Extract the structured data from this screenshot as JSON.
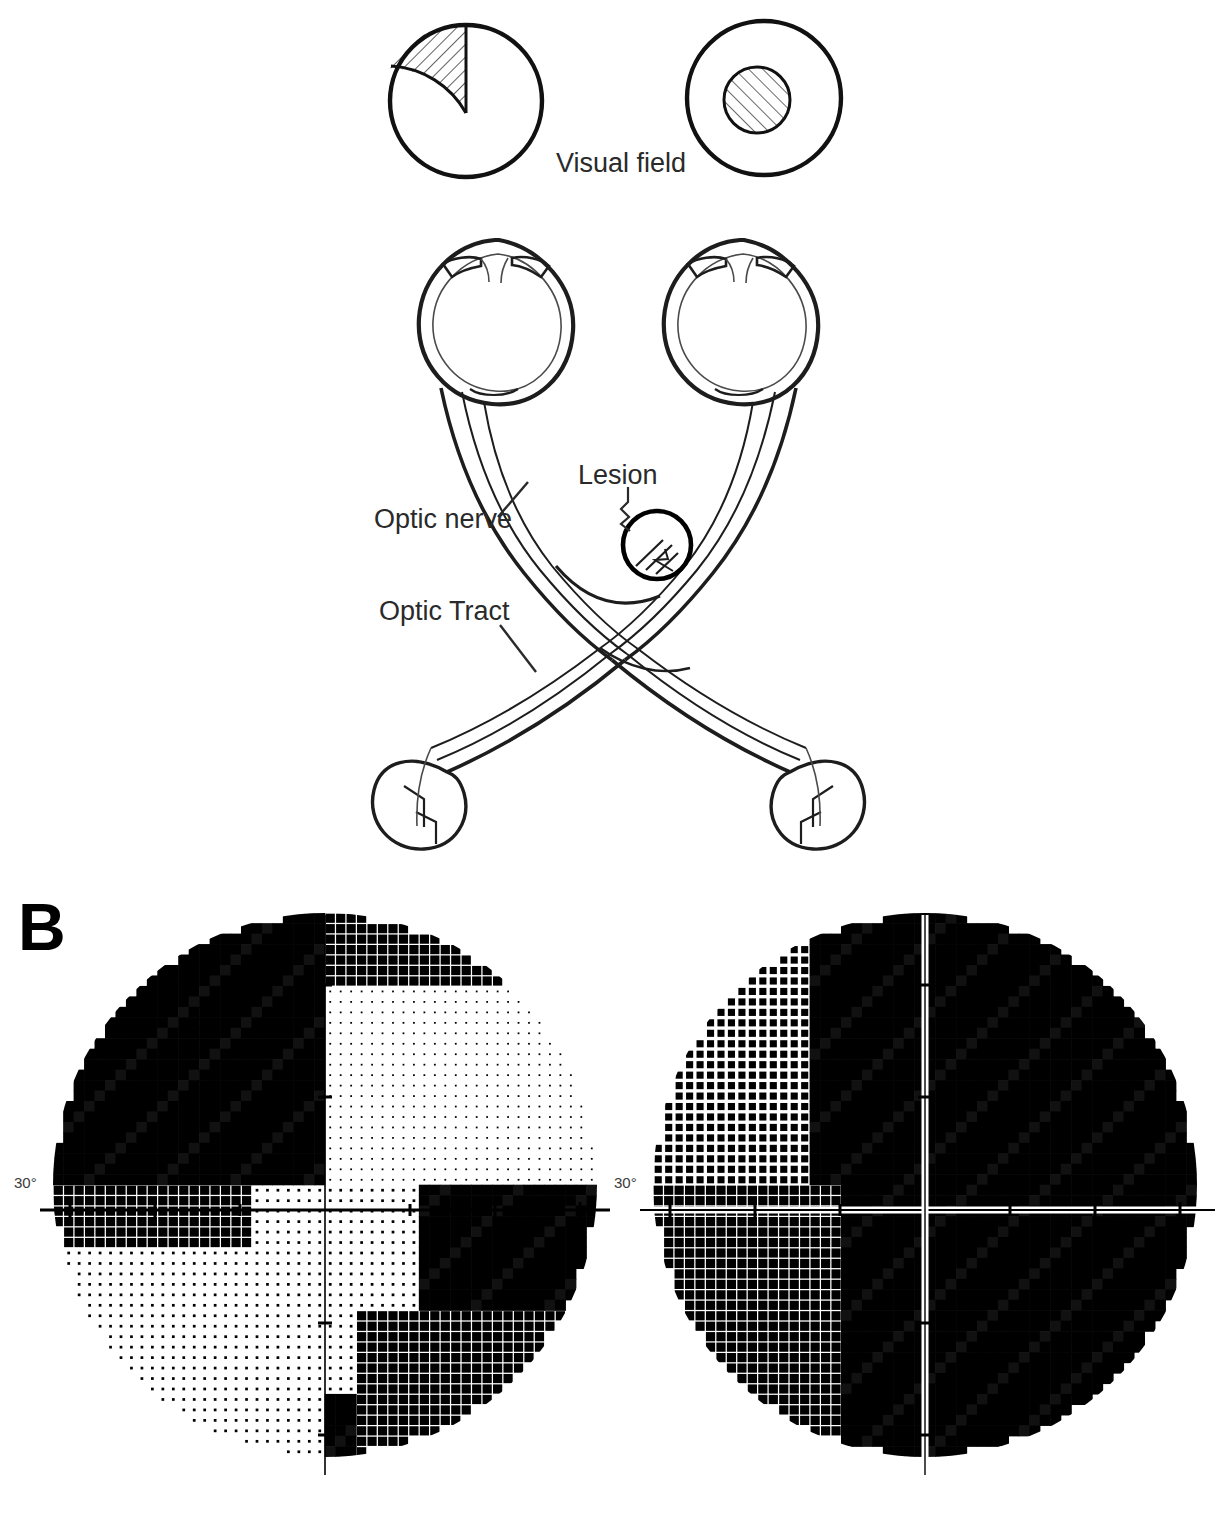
{
  "figure": {
    "panels": [
      {
        "id": "A",
        "letter": "",
        "caption": ""
      },
      {
        "id": "B",
        "letter": "B",
        "caption": ""
      }
    ]
  },
  "top_diagram": {
    "visual_field_label": "Visual field",
    "fields": [
      {
        "eye": "left",
        "name": "left-visual-field-circle",
        "defect_type": "superior-nasal-quadrant-wedge",
        "shaded": true
      },
      {
        "eye": "right",
        "name": "right-visual-field-circle",
        "defect_type": "central-scotoma",
        "shaded": true
      }
    ],
    "labels": {
      "optic_nerve": "Optic nerve",
      "optic_tract": "Optic Tract",
      "lesion": "Lesion"
    },
    "structures": [
      "left-eyeball",
      "right-eyeball",
      "left-optic-nerve",
      "right-optic-nerve",
      "optic-chiasm",
      "left-optic-tract",
      "right-optic-tract",
      "left-lateral-geniculate-body",
      "right-lateral-geniculate-body",
      "lesion-marker"
    ],
    "lesion_location": "junction of right optic nerve and chiasm"
  },
  "perimetry": {
    "axis_label": "30°",
    "plots": [
      {
        "name": "left-eye-perimetry",
        "eye": "left",
        "axis_label": "30°",
        "description": "superior and nasal field loss with dense defect upper-left, inferior-temporal arcuate defect"
      },
      {
        "name": "right-eye-perimetry",
        "eye": "right",
        "axis_label": "30°",
        "description": "near-total field loss, dense hemianopic black field"
      }
    ]
  },
  "chart_data": {
    "type": "heatmap",
    "xlabel": "",
    "ylabel": "",
    "grid": false,
    "legend": "none",
    "axis_ticks": [
      "30°"
    ],
    "series": [
      {
        "name": "left-eye-grayscale",
        "grid_size": [
          26,
          26
        ],
        "radius_degrees": 30,
        "quadrant_density": {
          "superior_nasal": 0.97,
          "superior_temporal": 0.12,
          "inferior_nasal": 0.3,
          "inferior_temporal": 0.55
        }
      },
      {
        "name": "right-eye-grayscale",
        "grid_size": [
          26,
          26
        ],
        "radius_degrees": 30,
        "quadrant_density": {
          "superior_nasal": 0.72,
          "superior_temporal": 1.0,
          "inferior_nasal": 0.88,
          "inferior_temporal": 1.0
        }
      }
    ]
  },
  "colors": {
    "ink": "#1a1a1a",
    "line": "#2a2a2a",
    "dense": "#000000",
    "paper": "#ffffff"
  }
}
